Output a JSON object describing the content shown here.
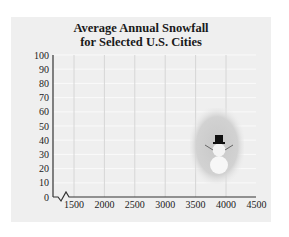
{
  "chart_data": {
    "type": "bar",
    "title": "Average Annual Snowfall for Selected U.S. Cities",
    "title_lines": [
      "Average Annual Snowfall",
      "for Selected U.S. Cities"
    ],
    "xlabel": "",
    "ylabel": "",
    "x_ticks": [
      1500,
      2000,
      2500,
      3000,
      3500,
      4000,
      4500
    ],
    "y_ticks": [
      0,
      10,
      20,
      30,
      40,
      50,
      60,
      70,
      80,
      90,
      100
    ],
    "xlim": [
      1000,
      4500
    ],
    "ylim": [
      0,
      100
    ],
    "x_axis_break": true,
    "grid": true,
    "categories": [],
    "series": [],
    "annotations": [
      "snowman illustration"
    ]
  },
  "colors": {
    "panel": "#efefef",
    "grid": "#d6d6d6",
    "axis": "#333333",
    "text": "#1a1a1a"
  }
}
